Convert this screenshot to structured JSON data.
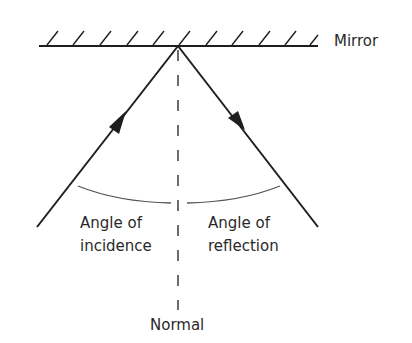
{
  "labels": {
    "mirror": "Mirror",
    "incidence_line1": "Angle of",
    "incidence_line2": "incidence",
    "reflection_line1": "Angle of",
    "reflection_line2": "reflection",
    "normal": "Normal"
  },
  "colors": {
    "line": "#1e1e1e",
    "arc": "#555555",
    "text": "#2a2a2a"
  },
  "elements": {
    "mirror": "mirror-surface-with-hatching",
    "incident_ray": "arrow-toward-mirror",
    "reflected_ray": "arrow-away-from-mirror",
    "normal": "dashed-vertical-line",
    "angle_arcs": [
      "angle-of-incidence-arc",
      "angle-of-reflection-arc"
    ]
  }
}
